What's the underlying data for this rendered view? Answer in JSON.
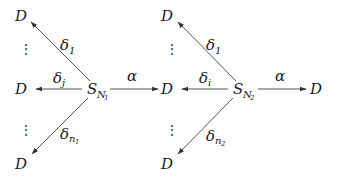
{
  "diagram": {
    "type": "state-transition",
    "colors": {
      "edge": "#555555",
      "text": "#1a1a1a",
      "background": "#ffffff"
    },
    "blocks": [
      {
        "source": {
          "base": "S",
          "sub": "N",
          "subsub": "1"
        },
        "targets": [
          {
            "label": "D",
            "edge": {
              "base": "δ",
              "sub": "1"
            }
          },
          {
            "label": "D",
            "edge": {
              "base": "δ",
              "sub": "j"
            }
          },
          {
            "label": "D",
            "edge": {
              "base": "δ",
              "sub": "n",
              "subsub": "1"
            }
          }
        ],
        "ellipsis": [
          "⋮",
          "⋮"
        ],
        "forward_edge": {
          "label": "α"
        }
      },
      {
        "source": {
          "base": "S",
          "sub": "N",
          "subsub": "2"
        },
        "targets": [
          {
            "label": "D",
            "edge": {
              "base": "δ",
              "sub": "1"
            }
          },
          {
            "label": "D",
            "edge": {
              "base": "δ",
              "sub": "i"
            }
          },
          {
            "label": "D",
            "edge": {
              "base": "δ",
              "sub": "n",
              "subsub": "2"
            }
          }
        ],
        "ellipsis": [
          "⋮",
          "⋮"
        ],
        "forward_edge": {
          "label": "α",
          "target": "D"
        }
      }
    ]
  }
}
